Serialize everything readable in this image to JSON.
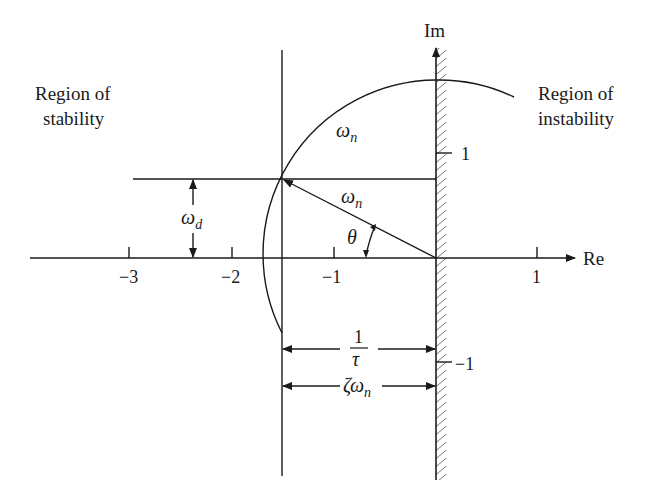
{
  "diagram": {
    "type": "s-plane pole location diagram",
    "axes": {
      "real_label": "Re",
      "imag_label": "Im",
      "real_ticks": [
        "−3",
        "−2",
        "−1",
        "1"
      ],
      "imag_ticks": [
        "1",
        "−1"
      ]
    },
    "regions": {
      "left_line1": "Region of",
      "left_line2": "stability",
      "right_line1": "Region of",
      "right_line2": "instability"
    },
    "annotations": {
      "omega": "ω",
      "n_sub": "n",
      "d_sub": "d",
      "theta": "θ",
      "one": "1",
      "tau": "τ",
      "zeta": "ζ"
    },
    "pole": {
      "re": -1.5,
      "im": 0.75
    },
    "colors": {
      "ink": "#1a1a1a",
      "background": "#ffffff"
    }
  }
}
